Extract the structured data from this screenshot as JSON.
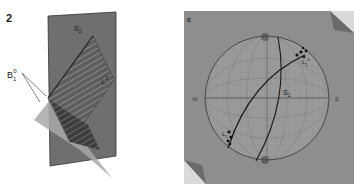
{
  "figure": {
    "panel_left": {
      "label": "2",
      "plane_label": "S",
      "plane_sub": "2",
      "bedding_label": "B",
      "bedding_sub": "1",
      "bedding_sup": "0",
      "lineation_label": "L",
      "lineation_sup": "0"
    },
    "panel_right": {
      "label": "c",
      "plane_label": "S",
      "plane_sub": "2",
      "lineation_top_label": "L",
      "lineation_top_sup": "0",
      "lineation_top_sub": "1",
      "lineation_bottom_label": "L",
      "lineation_bottom_sup": "0",
      "lineation_bottom_sub": "1",
      "west_label": "W",
      "east_label": "E"
    }
  },
  "colors": {
    "background": "#ffffff",
    "net_background": "#8f8f8f",
    "plane_dark": "#6e6e6e",
    "plane_light": "#a9a9a9",
    "ink": "#1a1a1a"
  }
}
